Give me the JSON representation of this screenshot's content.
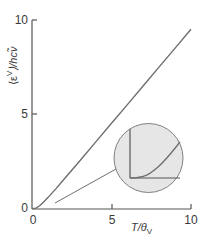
{
  "chart_data": {
    "type": "line",
    "title": "",
    "xlabel": "T/θV",
    "ylabel": "⟨εV⟩/hcν̃",
    "xlim": [
      0,
      10
    ],
    "ylim": [
      0,
      10
    ],
    "xticks": [
      0,
      5,
      10
    ],
    "yticks": [
      0,
      5,
      10
    ],
    "grid": false,
    "legend": null,
    "series": [
      {
        "name": "mean vibrational energy",
        "x": [
          0,
          0.25,
          0.5,
          0.75,
          1,
          1.5,
          2,
          3,
          4,
          5,
          6,
          7,
          8,
          9,
          10
        ],
        "values": [
          0,
          0.02,
          0.16,
          0.36,
          0.58,
          1.04,
          1.54,
          2.52,
          3.52,
          4.52,
          5.51,
          6.51,
          7.51,
          8.51,
          9.51
        ]
      }
    ],
    "annotations": [
      {
        "type": "inset-magnifier",
        "description": "circular magnified view of the curve near the origin showing gradual (exponential) onset"
      }
    ]
  },
  "axes": {
    "x_tick_labels": [
      "0",
      "5",
      "10"
    ],
    "y_tick_labels": [
      "0",
      "5",
      "10"
    ],
    "x_label_main": "T/θ",
    "x_label_sub": "V",
    "y_label_main": "⟨ε",
    "y_label_sup": "V",
    "y_label_rest": "⟩/hcν̃"
  },
  "colors": {
    "axis": "#555555",
    "curve": "#6e6e6e",
    "inset_fill": "#e6e6e6",
    "inset_stroke": "#808080"
  }
}
